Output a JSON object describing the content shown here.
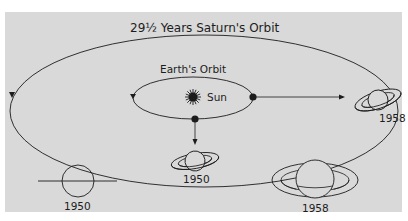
{
  "diagram": {
    "title": "29½ Years  Saturn's Orbit",
    "inner_orbit_label": "Earth's Orbit",
    "sun_label": "Sun",
    "saturn_positions": [
      {
        "year": "1950",
        "location": "bottom of orbit"
      },
      {
        "year": "1958",
        "location": "right of orbit"
      }
    ],
    "views": [
      {
        "year": "1950",
        "description": "Saturn seen edge-on, rings appear as a line"
      },
      {
        "year": "1958",
        "description": "Saturn with rings wide open"
      }
    ]
  },
  "colors": {
    "background": "#ffffff",
    "panel": "#d9d9d9",
    "ink": "#1c1c1c"
  }
}
